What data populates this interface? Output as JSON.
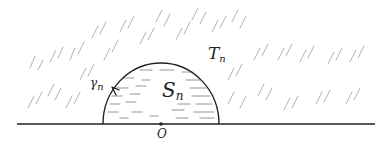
{
  "labels": {
    "region_outer": {
      "main": "T",
      "sub": "n"
    },
    "region_inner": {
      "main": "S",
      "sub": "n"
    },
    "curve": {
      "main": "γ",
      "sub": "n"
    },
    "origin": "O"
  },
  "geometry": {
    "axis": {
      "x1": 17,
      "x2": 375,
      "y": 124
    },
    "semicircle": {
      "cx": 161,
      "cy": 124,
      "rx": 58,
      "ry": 61
    },
    "orientation": "clockwise-arrow-on-left-arc"
  },
  "colors": {
    "stroke": "#222222",
    "hatch": "#9a9a9a",
    "fill_lines": "#8a8a8a"
  }
}
